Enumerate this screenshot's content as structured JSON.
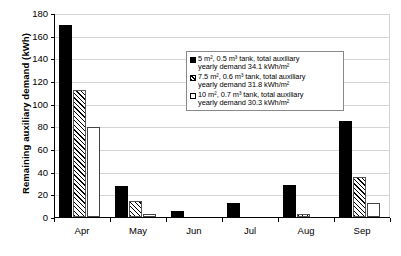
{
  "chart_data": {
    "type": "bar",
    "title": "",
    "xlabel": "",
    "ylabel": "Remaining auxiliary demand (kWh)",
    "ylim": [
      0,
      180
    ],
    "ytick_step": 20,
    "yticks": [
      "180",
      "160",
      "140",
      "120",
      "100",
      "80",
      "60",
      "40",
      "20",
      "0"
    ],
    "grid": true,
    "legend_position": "inside-top-center",
    "categories": [
      "Apr",
      "May",
      "Jun",
      "Jul",
      "Aug",
      "Sep"
    ],
    "series": [
      {
        "name": "5 m², 0.5 m³ tank, total auxiliary yearly demand 34.1 kWh/m²",
        "key": "solid",
        "values": [
          169,
          27,
          5,
          12,
          28,
          85
        ]
      },
      {
        "name": "7.5 m², 0.6 m³ tank, total auxiliary yearly demand 31.8 kWh/m²",
        "key": "hatch",
        "values": [
          112,
          14,
          0,
          0,
          3,
          35
        ]
      },
      {
        "name": "10 m², 0.7 m³ tank, total auxiliary yearly demand 30.3 kWh/m²",
        "key": "open",
        "values": [
          79,
          3,
          0,
          0,
          0,
          12
        ]
      }
    ]
  },
  "legend": {
    "entries": [
      {
        "line1": "5 m², 0.5 m³ tank, total auxiliary",
        "line2": "yearly demand 34.1 kWh/m²"
      },
      {
        "line1": "7.5 m², 0.6 m³ tank, total auxiliary",
        "line2": "yearly demand 31.8 kWh/m²"
      },
      {
        "line1": "10 m², 0.7 m³ tank, total auxiliary",
        "line2": "yearly demand 30.3 kWh/m²"
      }
    ]
  },
  "colors": {
    "series_solid": "#000000",
    "series_hatch": "#ffffff",
    "series_open": "#ffffff",
    "grid": "#d4d4d4",
    "axis": "#000000",
    "background": "#ffffff"
  }
}
